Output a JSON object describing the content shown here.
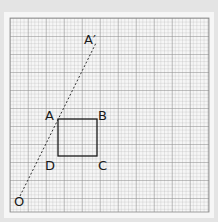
{
  "diagram": {
    "type": "enlargement-grid",
    "grid": {
      "minor_spacing_px": 3.6,
      "major_every": 5,
      "color_minor": "#b8b8b8",
      "color_major": "#8a8a8a"
    },
    "shape": {
      "name": "square ABCD",
      "vertices": [
        "A",
        "B",
        "C",
        "D"
      ]
    },
    "points": {
      "A": {
        "label": "A",
        "x": 58,
        "y": 119
      },
      "B": {
        "label": "B",
        "x": 97,
        "y": 119
      },
      "C": {
        "label": "C",
        "x": 97,
        "y": 156
      },
      "D": {
        "label": "D",
        "x": 58,
        "y": 156
      },
      "A_prime": {
        "label": "A′",
        "x": 96,
        "y": 45
      },
      "O": {
        "label": "O",
        "x": 20,
        "y": 196
      }
    },
    "line": {
      "from": "O",
      "to": "A′",
      "style": "dashed"
    }
  }
}
